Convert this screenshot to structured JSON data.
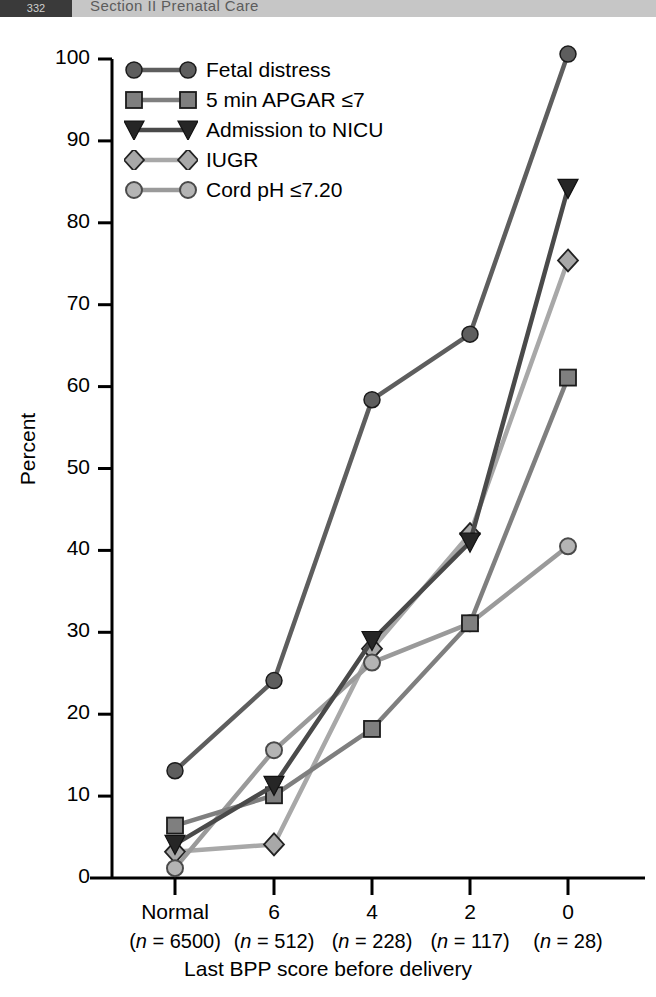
{
  "header": {
    "folio": "332",
    "running_title": "Section II   Prenatal Care"
  },
  "chart_data": {
    "type": "line",
    "title": "",
    "xlabel": "Last BPP score before delivery",
    "ylabel": "Percent",
    "ylim": [
      0,
      100
    ],
    "yticks": [
      0,
      10,
      20,
      30,
      40,
      50,
      60,
      70,
      80,
      90,
      100
    ],
    "ytick_labels": [
      "0",
      "10",
      "20",
      "30",
      "40",
      "50",
      "60",
      "70",
      "80",
      "90",
      "100"
    ],
    "grid": false,
    "legend_position": "upper-left-inside",
    "categories": [
      "Normal",
      "6",
      "4",
      "2",
      "0"
    ],
    "category_n": [
      "(n = 6500)",
      "(n = 512)",
      "(n = 228)",
      "(n = 117)",
      "(n = 28)"
    ],
    "category_n_values": [
      6500,
      512,
      228,
      117,
      28
    ],
    "series": [
      {
        "name": "Fetal distress",
        "marker": "circle",
        "color": "#5e5e5e",
        "values": [
          13.1,
          24.1,
          58.4,
          66.4,
          100.6
        ]
      },
      {
        "name": "5 min APGAR ≤7",
        "marker": "square",
        "color": "#7f7f7f",
        "values": [
          6.4,
          10.1,
          18.2,
          31.1,
          61.1
        ]
      },
      {
        "name": "Admission to NICU",
        "marker": "triangle-down",
        "color": "#4a4a4a",
        "values": [
          4.1,
          11.3,
          29.0,
          41.0,
          84.2
        ]
      },
      {
        "name": "IUGR",
        "marker": "diamond",
        "color": "#a8a8a8",
        "values": [
          3.2,
          4.1,
          28.0,
          42.0,
          75.4
        ]
      },
      {
        "name": "Cord pH ≤7.20",
        "marker": "circle-open",
        "color": "#9a9a9a",
        "values": [
          1.2,
          15.6,
          26.3,
          31.1,
          40.5
        ]
      }
    ]
  }
}
